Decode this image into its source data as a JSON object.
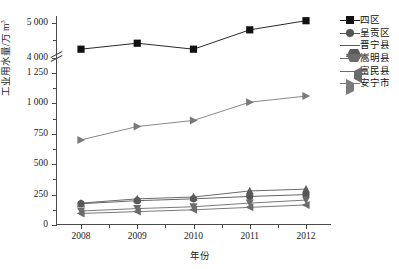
{
  "chart_data": {
    "type": "line",
    "title": "",
    "xlabel": "年份",
    "ylabel": "工业用水量/万 m",
    "ylabel_exponent": "3",
    "x": [
      "2008",
      "2009",
      "2010",
      "2011",
      "2012"
    ],
    "categories": [
      "2008",
      "2009",
      "2010",
      "2011",
      "2012"
    ],
    "ytick_labels": [
      "0",
      "250",
      "500",
      "750",
      "1 000",
      "1 250",
      "4 000",
      "5 000"
    ],
    "ytick_values": [
      0,
      250,
      500,
      750,
      1000,
      1250,
      4000,
      5000
    ],
    "ylim": [
      0,
      5250
    ],
    "axis_break": true,
    "axis_break_between": [
      1250,
      4000
    ],
    "grid": false,
    "legend_position": "right",
    "series": [
      {
        "name": "四区",
        "marker": "square",
        "color": "#111111",
        "values": [
          4250,
          4420,
          4250,
          4800,
          5060
        ]
      },
      {
        "name": "呈贡区",
        "marker": "circle",
        "color": "#555555",
        "values": [
          175,
          200,
          215,
          235,
          250
        ]
      },
      {
        "name": "晋宁县",
        "marker": "triangle-up",
        "color": "#5a5a5a",
        "values": [
          180,
          215,
          230,
          280,
          295
        ]
      },
      {
        "name": "嵩明县",
        "marker": "triangle-down",
        "color": "#6b6b6b",
        "values": [
          115,
          135,
          150,
          180,
          205
        ]
      },
      {
        "name": "富民县",
        "marker": "triangle-left",
        "color": "#6b6b6b",
        "values": [
          95,
          110,
          125,
          145,
          165
        ]
      },
      {
        "name": "安宁市",
        "marker": "triangle-right",
        "color": "#7a7a7a",
        "values": [
          700,
          810,
          860,
          1010,
          1060
        ]
      }
    ]
  },
  "legend": {
    "items": [
      {
        "label": "四区"
      },
      {
        "label": "呈贡区"
      },
      {
        "label": "晋宁县"
      },
      {
        "label": "嵩明县"
      },
      {
        "label": "富民县"
      },
      {
        "label": "安宁市"
      }
    ]
  },
  "axes": {
    "y_title": "工业用水量/万 m",
    "y_title_sup": "3",
    "x_title": "年份"
  }
}
